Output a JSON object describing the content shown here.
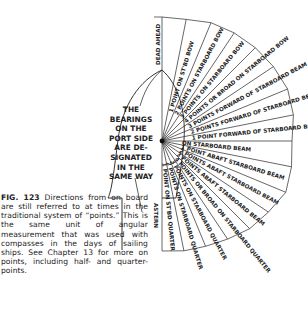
{
  "figure": {
    "number_label": "FIG. 123",
    "caption": "Directions from on board are still referred to at times in the traditional system of “points.” This is the same unit of angular measurement that was used with compasses in the days of sailing ships. See Chapter 13 for more on points, including half- and quarter-points."
  },
  "port_note": {
    "lines": [
      "THE",
      "BEARINGS",
      "ON THE",
      "PORT SIDE",
      "ARE DE-",
      "SIGNATED",
      "IN THE",
      "SAME WAY"
    ]
  },
  "bearings": [
    {
      "index": 0,
      "label": "DEAD AHEAD"
    },
    {
      "index": 1,
      "label": "1 POINT ON ST'BD BOW"
    },
    {
      "index": 2,
      "label": "2 POINTS ON STARBOARD BOW"
    },
    {
      "index": 3,
      "label": "3 POINTS ON STARBOARD BOW"
    },
    {
      "index": 4,
      "label": "4 POINTS OR BROAD ON STARBOARD BOW"
    },
    {
      "index": 5,
      "label": "3 POINTS FORWARD OF STARBOARD BEAM"
    },
    {
      "index": 6,
      "label": "2 POINTS FORWARD OF STARBOARD BEAM"
    },
    {
      "index": 7,
      "label": "1 POINT FORWARD OF STARBOARD BEAM"
    },
    {
      "index": 8,
      "label": "ON STARBOARD BEAM"
    },
    {
      "index": 9,
      "label": "1 POINT ABAFT STARBOARD BEAM"
    },
    {
      "index": 10,
      "label": "2 POINTS ABAFT STARBOARD BEAM"
    },
    {
      "index": 11,
      "label": "3 POINTS ABAFT STARBOARD BEAM"
    },
    {
      "index": 12,
      "label": "4 POINTS OR BROAD ON STARBOARD QUARTER"
    },
    {
      "index": 13,
      "label": "3 POINTS ON STARBOARD QUARTER"
    },
    {
      "index": 14,
      "label": "2 POINTS ON STARBOARD QUARTER"
    },
    {
      "index": 15,
      "label": "1 POINT ON ST'BD QUARTER"
    },
    {
      "index": 16,
      "label": "ASTERN"
    }
  ]
}
